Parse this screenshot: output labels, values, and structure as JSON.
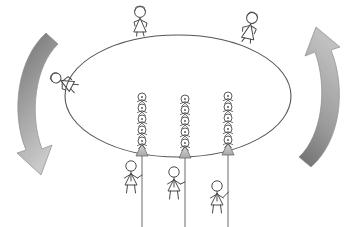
{
  "diagram": {
    "title": "Stick figure crowd on rotating ellipse platform",
    "type": "conceptual-line-drawing",
    "background_color": "#ffffff",
    "line_color": "#4a4a4a",
    "fill_color": "#ffffff",
    "canvas": {
      "width": 359,
      "height": 227
    }
  },
  "platform": {
    "label": "ellipse-platform",
    "shape": "ellipse",
    "center_x": 178,
    "center_y": 96,
    "radius_x": 113,
    "radius_y": 61,
    "stroke": "#555555",
    "stroke_width": 1.1,
    "fill": "#ffffff"
  },
  "arrows": {
    "left": {
      "label": "counterclockwise-rotation-arrow-left",
      "direction": "down",
      "gradient_from": "#6e6e6e",
      "gradient_to": "#c9c9c9",
      "stroke": "#8d8d8d"
    },
    "right": {
      "label": "counterclockwise-rotation-arrow-right",
      "direction": "up",
      "gradient_from": "#6e6e6e",
      "gradient_to": "#c0c0c0",
      "stroke": "#8d8d8d"
    }
  },
  "top_figures": [
    {
      "name": "figure-top-left",
      "x": 140,
      "y": 22,
      "scale": 1.0,
      "pose": "standing-walking",
      "flip": false
    },
    {
      "name": "figure-top-right",
      "x": 250,
      "y": 27,
      "scale": 1.0,
      "pose": "climbing",
      "flip": false
    }
  ],
  "edge_figures": [
    {
      "name": "figure-falling-left-edge",
      "x": 55,
      "y": 80,
      "scale": 0.92,
      "pose": "falling",
      "rotation": -55
    }
  ],
  "columns": [
    {
      "name": "column-left",
      "x": 142,
      "base_y": 155,
      "stack_count": 5,
      "figure_spacing": 11,
      "cone_fill": "#b9b9b9",
      "rope_x": 142,
      "rope_bottom": 227,
      "hanging_figure": {
        "name": "figure-hanging-left",
        "x": 131,
        "y": 168,
        "scale": 1.0
      }
    },
    {
      "name": "column-middle",
      "x": 185,
      "base_y": 157,
      "stack_count": 5,
      "figure_spacing": 11,
      "cone_fill": "#b9b9b9",
      "rope_x": 185,
      "rope_bottom": 227,
      "hanging_figure": {
        "name": "figure-hanging-middle",
        "x": 174,
        "y": 174,
        "scale": 1.0
      }
    },
    {
      "name": "column-right",
      "x": 228,
      "base_y": 154,
      "stack_count": 5,
      "figure_spacing": 11,
      "cone_fill": "#b9b9b9",
      "rope_x": 228,
      "rope_bottom": 227,
      "hanging_figure": {
        "name": "figure-hanging-right",
        "x": 218,
        "y": 188,
        "scale": 1.0
      }
    }
  ],
  "counts": {
    "total_columns": 3,
    "figures_per_column": 5,
    "top_figures": 2,
    "hanging_figures": 3,
    "falling_figures": 1
  }
}
